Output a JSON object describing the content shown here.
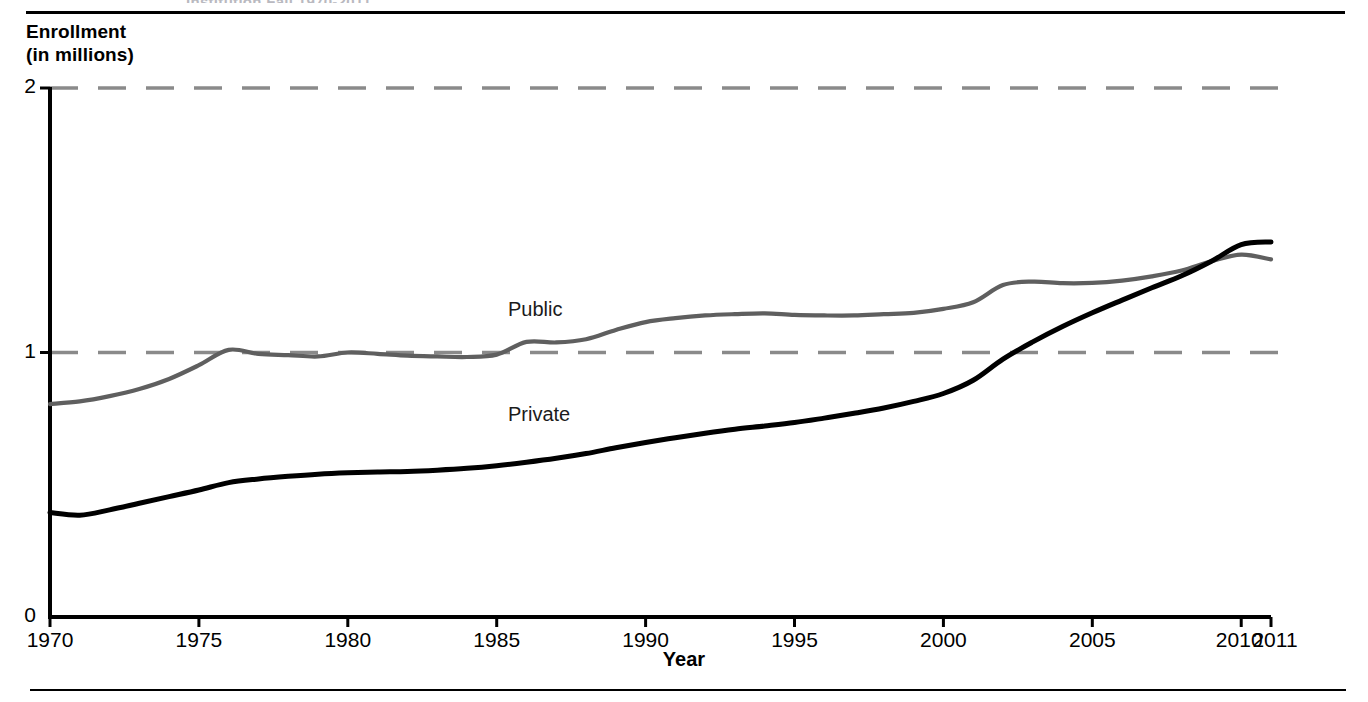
{
  "figure": {
    "clipped_header": "Institution Fall 1970-2011",
    "y_axis_title": "Enrollment\n(in millions)",
    "x_axis_title": "Year"
  },
  "chart_data": {
    "type": "line",
    "title": "",
    "xlabel": "Year",
    "ylabel": "Enrollment (in millions)",
    "xlim": [
      1970,
      2011
    ],
    "ylim": [
      0,
      2
    ],
    "yticks": [
      0,
      1,
      2
    ],
    "ytick_labels": [
      "0",
      "1",
      "2"
    ],
    "xticks": [
      1970,
      1975,
      1980,
      1985,
      1990,
      1995,
      2000,
      2005,
      2010,
      2011
    ],
    "xtick_labels": [
      "1970",
      "1975",
      "1980",
      "1985",
      "1990",
      "1995",
      "2000",
      "2005",
      "2010",
      "2011"
    ],
    "grid": "horizontal-dashed",
    "gridlines": [
      1,
      2
    ],
    "legend": "inline-labels",
    "series": [
      {
        "name": "Public",
        "label": "Public",
        "color": "#5f5f5f",
        "style": "solid",
        "x": [
          1970,
          1971,
          1972,
          1973,
          1974,
          1975,
          1976,
          1977,
          1978,
          1979,
          1980,
          1981,
          1982,
          1983,
          1984,
          1985,
          1986,
          1987,
          1988,
          1989,
          1990,
          1991,
          1992,
          1993,
          1994,
          1995,
          1996,
          1997,
          1998,
          1999,
          2000,
          2001,
          2002,
          2003,
          2004,
          2005,
          2006,
          2007,
          2008,
          2009,
          2010,
          2011
        ],
        "values": [
          0.805,
          0.815,
          0.835,
          0.862,
          0.9,
          0.952,
          1.01,
          0.995,
          0.99,
          0.985,
          1.0,
          0.995,
          0.988,
          0.985,
          0.983,
          0.992,
          1.04,
          1.038,
          1.05,
          1.085,
          1.115,
          1.13,
          1.14,
          1.145,
          1.148,
          1.142,
          1.14,
          1.14,
          1.145,
          1.15,
          1.165,
          1.19,
          1.255,
          1.268,
          1.262,
          1.263,
          1.272,
          1.288,
          1.31,
          1.345,
          1.37,
          1.352
        ]
      },
      {
        "name": "Private",
        "label": "Private",
        "color": "#000000",
        "style": "solid",
        "x": [
          1970,
          1971,
          1972,
          1973,
          1974,
          1975,
          1976,
          1977,
          1978,
          1979,
          1980,
          1981,
          1982,
          1983,
          1984,
          1985,
          1986,
          1987,
          1988,
          1989,
          1990,
          1991,
          1992,
          1993,
          1994,
          1995,
          1996,
          1997,
          1998,
          1999,
          2000,
          2001,
          2002,
          2003,
          2004,
          2005,
          2006,
          2007,
          2008,
          2009,
          2010,
          2011
        ],
        "values": [
          0.395,
          0.385,
          0.405,
          0.43,
          0.455,
          0.48,
          0.508,
          0.522,
          0.532,
          0.54,
          0.545,
          0.548,
          0.55,
          0.555,
          0.562,
          0.572,
          0.585,
          0.6,
          0.618,
          0.64,
          0.66,
          0.678,
          0.695,
          0.71,
          0.722,
          0.735,
          0.752,
          0.77,
          0.79,
          0.815,
          0.845,
          0.895,
          0.975,
          1.04,
          1.098,
          1.15,
          1.198,
          1.245,
          1.29,
          1.345,
          1.408,
          1.418
        ]
      }
    ]
  }
}
